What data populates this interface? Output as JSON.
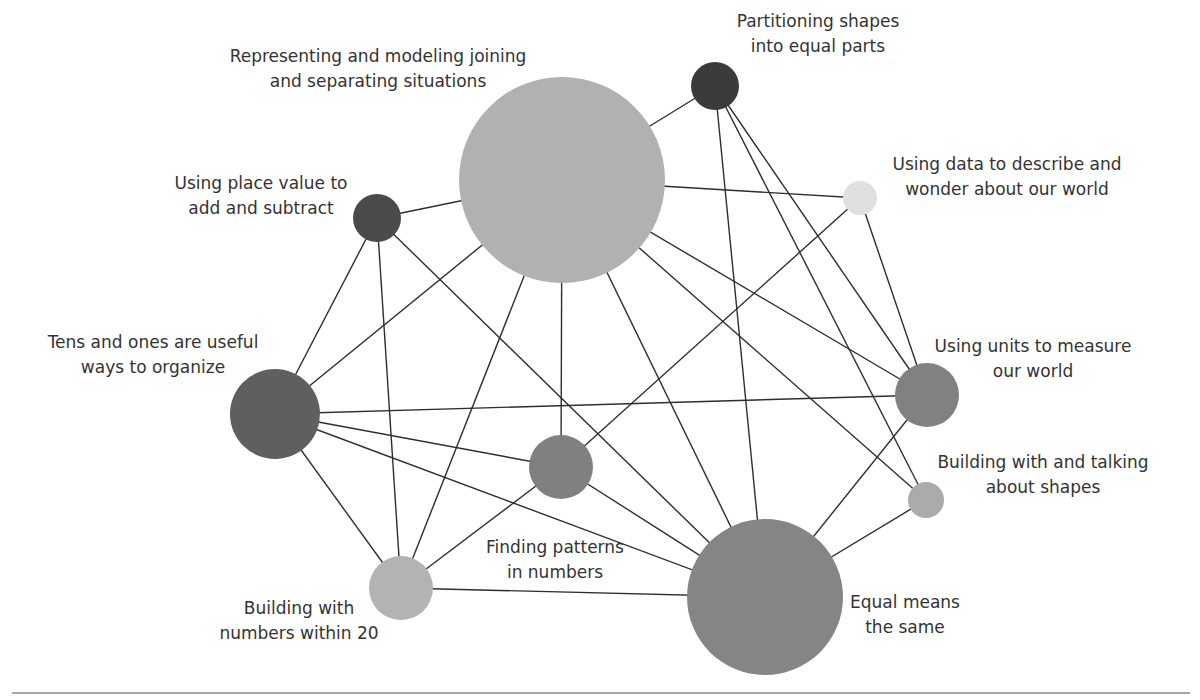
{
  "diagram": {
    "type": "network",
    "nodes": [
      {
        "id": "representing",
        "label_lines": [
          "Representing and modeling joining",
          "and separating situations"
        ],
        "size": "largest",
        "shade": "#b1b1b1"
      },
      {
        "id": "partitioning",
        "label_lines": [
          "Partitioning shapes",
          "into equal parts"
        ],
        "size": "small",
        "shade": "#3b3b3b"
      },
      {
        "id": "data",
        "label_lines": [
          "Using data to describe and",
          "wonder about our world"
        ],
        "size": "smallest",
        "shade": "#e0e0e0"
      },
      {
        "id": "place_value",
        "label_lines": [
          "Using place value to",
          "add and subtract"
        ],
        "size": "small",
        "shade": "#4a4a4a"
      },
      {
        "id": "tens_ones",
        "label_lines": [
          "Tens and ones are useful",
          "ways to organize"
        ],
        "size": "medium",
        "shade": "#5f5f5f"
      },
      {
        "id": "units",
        "label_lines": [
          "Using units to measure",
          "our world"
        ],
        "size": "small-medium",
        "shade": "#818181"
      },
      {
        "id": "patterns",
        "label_lines": [
          "Finding patterns",
          "in numbers"
        ],
        "size": "small-medium",
        "shade": "#808080"
      },
      {
        "id": "shapes",
        "label_lines": [
          "Building with and talking",
          "about shapes"
        ],
        "size": "smallest",
        "shade": "#ababab"
      },
      {
        "id": "building20",
        "label_lines": [
          "Building with",
          "numbers within 20"
        ],
        "size": "small-medium",
        "shade": "#b3b3b3"
      },
      {
        "id": "equal",
        "label_lines": [
          "Equal means",
          "the same"
        ],
        "size": "large",
        "shade": "#858585"
      }
    ],
    "edges": [
      [
        "representing",
        "partitioning"
      ],
      [
        "representing",
        "data"
      ],
      [
        "representing",
        "place_value"
      ],
      [
        "representing",
        "tens_ones"
      ],
      [
        "representing",
        "building20"
      ],
      [
        "representing",
        "patterns"
      ],
      [
        "representing",
        "equal"
      ],
      [
        "representing",
        "units"
      ],
      [
        "representing",
        "shapes"
      ],
      [
        "partitioning",
        "equal"
      ],
      [
        "partitioning",
        "units"
      ],
      [
        "partitioning",
        "shapes"
      ],
      [
        "data",
        "patterns"
      ],
      [
        "data",
        "units"
      ],
      [
        "place_value",
        "tens_ones"
      ],
      [
        "place_value",
        "building20"
      ],
      [
        "place_value",
        "equal"
      ],
      [
        "tens_ones",
        "units"
      ],
      [
        "tens_ones",
        "patterns"
      ],
      [
        "tens_ones",
        "equal"
      ],
      [
        "tens_ones",
        "building20"
      ],
      [
        "patterns",
        "building20"
      ],
      [
        "patterns",
        "equal"
      ],
      [
        "building20",
        "equal"
      ],
      [
        "units",
        "equal"
      ],
      [
        "shapes",
        "equal"
      ]
    ]
  }
}
